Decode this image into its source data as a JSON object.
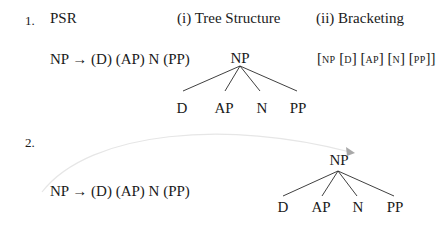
{
  "example1": {
    "number": "1.",
    "psr_heading": "PSR",
    "rule": "NP → (D) (AP) N (PP)",
    "tree_heading": "(i) Tree Structure",
    "bracket_heading": "(ii) Bracketing",
    "tree": {
      "root": "NP",
      "children": [
        "D",
        "AP",
        "N",
        "PP"
      ]
    },
    "bracketing": {
      "open": "[",
      "root": "NP",
      "items": [
        "D",
        "AP",
        "N",
        "PP"
      ],
      "close": "]"
    }
  },
  "example2": {
    "number": "2.",
    "rule": "NP → (D) (AP)  N  (PP)",
    "tree": {
      "root": "NP",
      "children": [
        "D",
        "AP",
        "N",
        "PP"
      ]
    },
    "arrow": "curved arrow from rule to tree root"
  }
}
